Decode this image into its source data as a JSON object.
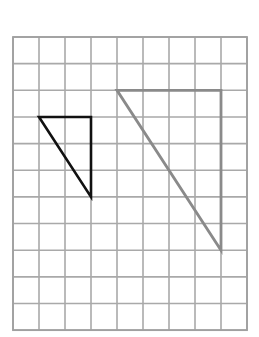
{
  "diagram": {
    "type": "grid-figure",
    "grid": {
      "columns": 9,
      "rows": 11,
      "line_color": "#a9a9a9"
    },
    "shapes": [
      {
        "name": "small-triangle",
        "kind": "right-triangle",
        "stroke_color": "#111111",
        "vertices_grid_units": [
          [
            1,
            3
          ],
          [
            3,
            3
          ],
          [
            3,
            6
          ]
        ],
        "horizontal_leg_units": 2,
        "vertical_leg_units": 3
      },
      {
        "name": "large-triangle",
        "kind": "right-triangle",
        "stroke_color": "#8a8a8a",
        "vertices_grid_units": [
          [
            4,
            2
          ],
          [
            8,
            2
          ],
          [
            8,
            8
          ]
        ],
        "horizontal_leg_units": 4,
        "vertical_leg_units": 6
      }
    ],
    "scale_factor": 2
  }
}
